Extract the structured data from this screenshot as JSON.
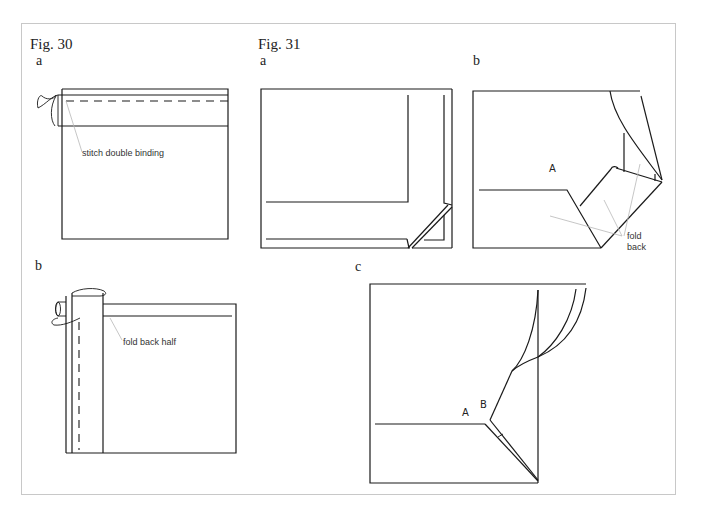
{
  "figures": [
    {
      "id": "fig30",
      "title": "Fig. 30",
      "panels": [
        {
          "label": "a",
          "annotation": "stitch double binding"
        },
        {
          "label": "b",
          "annotation": "fold back half"
        }
      ]
    },
    {
      "id": "fig31",
      "title": "Fig. 31",
      "panels": [
        {
          "label": "a"
        },
        {
          "label": "b",
          "point_labels": [
            "A"
          ],
          "annotation_line1": "fold",
          "annotation_line2": "back"
        },
        {
          "label": "c",
          "point_labels": [
            "A",
            "B"
          ]
        }
      ]
    }
  ],
  "colors": {
    "line": "#1a1a1a",
    "leader": "#b8b8b8",
    "frame": "#c8c8c8",
    "background": "#ffffff"
  }
}
